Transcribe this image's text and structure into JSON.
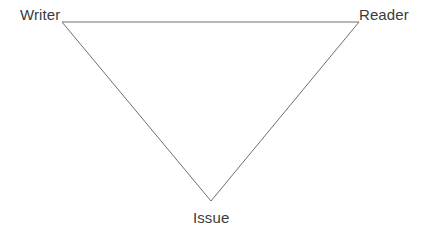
{
  "diagram": {
    "type": "inverted-triangle",
    "background_color": "#ffffff",
    "line_color": "#6e6e6e",
    "line_width": 1,
    "text_color": "#3b3b3b",
    "vertices": [
      {
        "id": "writer",
        "label": "Writer",
        "x": 62,
        "y": 22,
        "label_position": "top-left"
      },
      {
        "id": "reader",
        "label": "Reader",
        "x": 359,
        "y": 22,
        "label_position": "top-right"
      },
      {
        "id": "issue",
        "label": "Issue",
        "x": 211,
        "y": 201,
        "label_position": "bottom-center"
      }
    ],
    "edges": [
      {
        "from": "writer",
        "to": "reader"
      },
      {
        "from": "reader",
        "to": "issue"
      },
      {
        "from": "issue",
        "to": "writer"
      }
    ]
  }
}
